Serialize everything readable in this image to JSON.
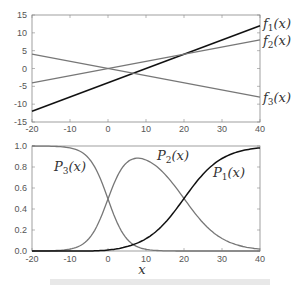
{
  "chart_data": [
    {
      "type": "line",
      "title": "",
      "xlabel": "",
      "ylabel": "",
      "xlim": [
        -20,
        40
      ],
      "ylim": [
        -15,
        15
      ],
      "xticks": [
        -20,
        -10,
        0,
        10,
        20,
        30,
        40
      ],
      "yticks": [
        -15,
        -10,
        -5,
        0,
        5,
        10,
        15
      ],
      "grid": false,
      "legend_position": "right, inline labels at x=40",
      "x": [
        -20,
        40
      ],
      "series": [
        {
          "name": "f1(x)",
          "label_main": "f",
          "label_sub": "1",
          "values": [
            -12,
            12
          ],
          "color": "#111111",
          "slope": 0.4,
          "intercept": -4
        },
        {
          "name": "f2(x)",
          "label_main": "f",
          "label_sub": "2",
          "values": [
            -4,
            8
          ],
          "color": "#777777",
          "slope": 0.2,
          "intercept": 0
        },
        {
          "name": "f3(x)",
          "label_main": "f",
          "label_sub": "3",
          "values": [
            4,
            -8
          ],
          "color": "#777777",
          "slope": -0.2,
          "intercept": 0
        }
      ]
    },
    {
      "type": "line",
      "title": "",
      "xlabel": "x",
      "ylabel": "",
      "xlim": [
        -20,
        40
      ],
      "ylim": [
        0,
        1
      ],
      "xticks": [
        -20,
        -10,
        0,
        10,
        20,
        30,
        40
      ],
      "yticks": [
        "0.0",
        "0.2",
        "0.4",
        "0.6",
        "0.8",
        "1.0"
      ],
      "grid": false,
      "legend_position": "inline labels",
      "x": [
        -20,
        -10,
        0,
        8,
        10,
        20,
        30,
        40
      ],
      "series": [
        {
          "name": "P1(x)",
          "label_main": "P",
          "label_sub": "1",
          "values": [
            0.0,
            0.001,
            0.018,
            0.1,
            0.12,
            0.5,
            0.88,
            0.98
          ],
          "color": "#111111"
        },
        {
          "name": "P2(x)",
          "label_main": "P",
          "label_sub": "2",
          "values": [
            0.0,
            0.12,
            0.5,
            0.89,
            0.88,
            0.5,
            0.12,
            0.018
          ],
          "color": "#777777"
        },
        {
          "name": "P3(x)",
          "label_main": "P",
          "label_sub": "3",
          "values": [
            1.0,
            0.88,
            0.48,
            0.09,
            0.05,
            0.0,
            0.0,
            0.0
          ],
          "color": "#777777"
        }
      ],
      "note": "P_i(x) = softmax of f_i(x)"
    }
  ],
  "labels": {
    "f1": "f",
    "f1s": "1",
    "f2": "f",
    "f2s": "2",
    "f3": "f",
    "f3s": "3",
    "p1": "P",
    "p1s": "1",
    "p2": "P",
    "p2s": "2",
    "p3": "P",
    "p3s": "3",
    "paren": "(x)",
    "xaxis": "x"
  }
}
